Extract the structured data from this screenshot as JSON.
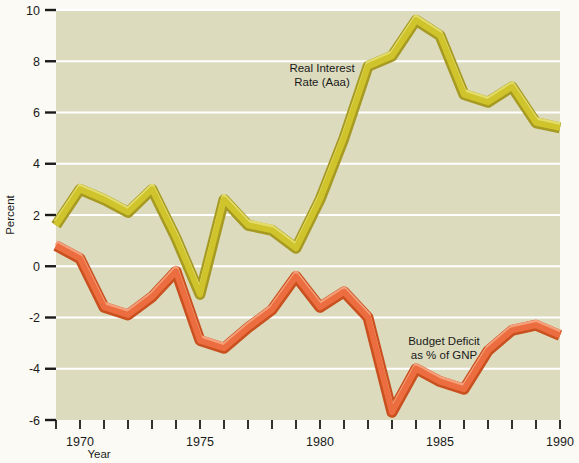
{
  "chart_data": {
    "type": "line",
    "title": "",
    "xlabel": "Year",
    "ylabel": "Percent",
    "xlim": [
      1969,
      1990
    ],
    "ylim": [
      -6,
      10
    ],
    "ytick_values": [
      10,
      8,
      6,
      4,
      2,
      0,
      -2,
      -4,
      -6
    ],
    "ytick_labels": [
      "10",
      "8",
      "6",
      "4",
      "2",
      "0",
      "-2",
      "-4",
      "-6"
    ],
    "xtick_values": [
      1969,
      1970,
      1971,
      1972,
      1973,
      1974,
      1975,
      1976,
      1977,
      1978,
      1979,
      1980,
      1981,
      1982,
      1983,
      1984,
      1985,
      1986,
      1987,
      1988,
      1989,
      1990
    ],
    "xtick_labeled": [
      {
        "value": 1970,
        "label": "1970"
      },
      {
        "value": 1975,
        "label": "1975"
      },
      {
        "value": 1980,
        "label": "1980"
      },
      {
        "value": 1985,
        "label": "1985"
      },
      {
        "value": 1990,
        "label": "1990"
      }
    ],
    "grid": "horizontal-white-gridlines",
    "legend_position": "inline-annotations",
    "x": [
      1969,
      1970,
      1971,
      1972,
      1973,
      1974,
      1975,
      1976,
      1977,
      1978,
      1979,
      1980,
      1981,
      1982,
      1983,
      1984,
      1985,
      1986,
      1987,
      1988,
      1989,
      1990
    ],
    "series": [
      {
        "name": "Real Interest Rate (Aaa)",
        "color": "#cfc42b",
        "highlight_color": "#e3dc6a",
        "shadow_color": "#a79a22",
        "label_line1": "Real Interest",
        "label_line2": "Rate (Aaa)",
        "values": [
          1.6,
          3.0,
          2.6,
          2.1,
          3.0,
          1.1,
          -1.1,
          2.6,
          1.6,
          1.4,
          0.7,
          2.6,
          5.0,
          7.8,
          8.2,
          9.6,
          9.0,
          6.7,
          6.4,
          7.0,
          5.6,
          5.4
        ]
      },
      {
        "name": "Budget Deficit as % of GNP",
        "color": "#ec6d3f",
        "highlight_color": "#f4a07a",
        "shadow_color": "#c9501f",
        "label_line1": "Budget Deficit",
        "label_line2": "as % of GNP",
        "values": [
          0.8,
          0.3,
          -1.6,
          -1.9,
          -1.2,
          -0.2,
          -2.9,
          -3.2,
          -2.4,
          -1.7,
          -0.4,
          -1.6,
          -1.0,
          -2.0,
          -5.7,
          -4.0,
          -4.5,
          -4.8,
          -3.3,
          -2.5,
          -2.3,
          -2.7
        ]
      }
    ]
  },
  "axes": {
    "y_title": "Percent",
    "x_title": "Year"
  },
  "colors": {
    "page_background": "#fbfaf4",
    "plot_background": "#dcdbbe",
    "gridline": "#ffffff",
    "tick": "#1a1a1a",
    "text": "#1a1a1a"
  }
}
